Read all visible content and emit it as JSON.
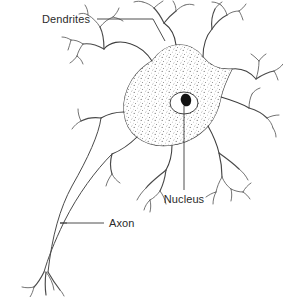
{
  "diagram": {
    "background_color": "#ffffff",
    "ink_color": "#3d3d3d",
    "text_color": "#2b2b2b",
    "width": 283,
    "height": 297
  },
  "labels": {
    "dendrites": "Dendrites",
    "nucleus": "Nucleus",
    "axon": "Axon"
  },
  "parts": {
    "soma_name": "cell-body",
    "nucleus_name": "nucleus",
    "nucleolus_name": "nucleolus",
    "axon_name": "axon",
    "axon_terminal_name": "axon-terminals",
    "dendrite_name": "dendrite"
  }
}
